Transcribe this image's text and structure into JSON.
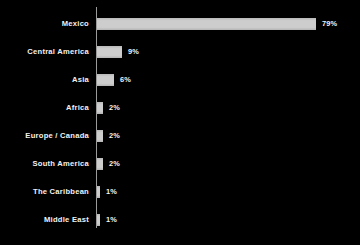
{
  "chart_data": {
    "type": "bar",
    "orientation": "horizontal",
    "title": "",
    "subtitle": "",
    "xlabel": "",
    "ylabel": "",
    "xlim": [
      0,
      79
    ],
    "grid": false,
    "legend": null,
    "value_suffix": "%",
    "categories": [
      "Mexico",
      "Central America",
      "Asia",
      "Africa",
      "Europe / Canada",
      "South America",
      "The Caribbean",
      "Middle East"
    ],
    "values": [
      79,
      9,
      6,
      2,
      2,
      2,
      1,
      1
    ],
    "value_labels": [
      "79%",
      "9%",
      "6%",
      "2%",
      "2%",
      "2%",
      "1%",
      "1%"
    ],
    "colors": {
      "background": "#000000",
      "bar_fill": "#cdcdcd",
      "axis_line": "#9a9a9a",
      "category_text": "#f2f2f2",
      "value_text": "#f4f4f4"
    }
  },
  "rows": [
    {
      "label": "Mexico",
      "value": 79,
      "value_label": "79%"
    },
    {
      "label": "Central America",
      "value": 9,
      "value_label": "9%"
    },
    {
      "label": "Asia",
      "value": 6,
      "value_label": "6%"
    },
    {
      "label": "Africa",
      "value": 2,
      "value_label": "2%"
    },
    {
      "label": "Europe / Canada",
      "value": 2,
      "value_label": "2%"
    },
    {
      "label": "South America",
      "value": 2,
      "value_label": "2%"
    },
    {
      "label": "The Caribbean",
      "value": 1,
      "value_label": "1%"
    },
    {
      "label": "Middle East",
      "value": 1,
      "value_label": "1%"
    }
  ],
  "layout": {
    "first_row_top": 18,
    "row_spacing": 28,
    "bar_height": 12,
    "bar_origin_x": 97,
    "px_per_unit": 2.772
  }
}
